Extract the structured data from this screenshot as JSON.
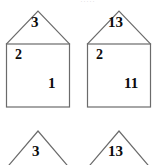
{
  "page": {
    "background_color": "#ffffff",
    "stroke_color": "#6b6b6b",
    "text_color": "#0b0b0b",
    "top_artifact_text": "= ....."
  },
  "houses": [
    {
      "id": "house-left",
      "roof_value": "3",
      "wall_top_left_value": "2",
      "wall_bottom_right_value": "1"
    },
    {
      "id": "house-right",
      "roof_value": "13",
      "wall_top_left_value": "2",
      "wall_bottom_right_value": "11"
    }
  ],
  "bottom_roofs": [
    {
      "id": "roof-bottom-left",
      "roof_value": "3"
    },
    {
      "id": "roof-bottom-right",
      "roof_value": "13"
    }
  ]
}
